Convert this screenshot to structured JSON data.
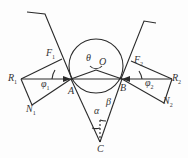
{
  "diagram": {
    "type": "force-diagram",
    "labels": {
      "F1": "F",
      "F1_sub": "1",
      "F2": "F",
      "F2_sub": "2",
      "R1": "R",
      "R1_sub": "1",
      "R2": "R",
      "R2_sub": "2",
      "N1": "N",
      "N1_sub": "1",
      "N2": "N",
      "N2_sub": "2",
      "phi1": "φ",
      "phi1_sub": "1",
      "phi2": "φ",
      "phi2_sub": "2",
      "theta": "θ",
      "O": "O",
      "A": "A",
      "B": "B",
      "C": "C",
      "alpha": "α",
      "beta": "β"
    },
    "colors": {
      "line": "#2a2a2a",
      "text": "#333333",
      "background": "#fdfdfd"
    }
  }
}
